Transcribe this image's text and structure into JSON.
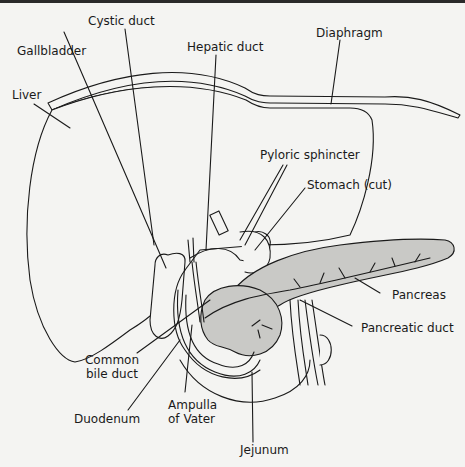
{
  "figure": {
    "background_color": "#f4f4f2",
    "organ_fill": "#c9c9c6",
    "line_color": "#1a1a1a"
  },
  "labels": {
    "cystic_duct": "Cystic duct",
    "gallbladder": "Gallbladder",
    "hepatic_duct": "Hepatic duct",
    "diaphragm": "Diaphragm",
    "liver": "Liver",
    "pyloric_sphincter": "Pyloric sphincter",
    "stomach_cut": "Stomach (cut)",
    "pancreas": "Pancreas",
    "pancreatic_duct": "Pancreatic duct",
    "common_bile_duct_line1": "Common",
    "common_bile_duct_line2": "bile duct",
    "duodenum": "Duodenum",
    "ampulla_line1": "Ampulla",
    "ampulla_line2": "of Vater",
    "jejunum": "Jejunum"
  }
}
